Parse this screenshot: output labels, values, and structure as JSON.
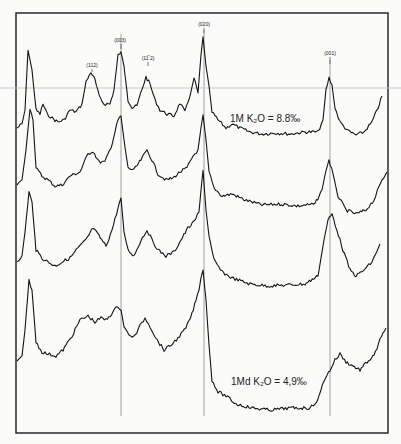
{
  "chart_data": {
    "type": "line",
    "title": "",
    "xlabel": "",
    "ylabel": "",
    "grid": false,
    "peak_labels": [
      {
        "label": "(112)",
        "x": 92
      },
      {
        "label": "(003)",
        "x": 121
      },
      {
        "label": "(11̅ 2)",
        "x": 148
      },
      {
        "label": "(020)",
        "x": 204
      },
      {
        "label": "(001)",
        "x": 330
      }
    ],
    "reference_lines_x": [
      121,
      204,
      330
    ],
    "annotations": [
      {
        "text": "1M  K₂O = 8.8‰",
        "x": 230,
        "y": 122
      },
      {
        "text": "1Md  K₂O = 4,9‰",
        "x": 231,
        "y": 385
      }
    ],
    "series": [
      {
        "name": "1M K2O = 8.8",
        "points": [
          [
            17,
            128
          ],
          [
            22,
            124
          ],
          [
            25,
            110
          ],
          [
            28,
            50
          ],
          [
            32,
            70
          ],
          [
            36,
            110
          ],
          [
            40,
            114
          ],
          [
            43,
            104
          ],
          [
            47,
            114
          ],
          [
            52,
            118
          ],
          [
            58,
            122
          ],
          [
            64,
            120
          ],
          [
            70,
            110
          ],
          [
            76,
            112
          ],
          [
            82,
            104
          ],
          [
            86,
            82
          ],
          [
            91,
            72
          ],
          [
            95,
            80
          ],
          [
            99,
            96
          ],
          [
            104,
            104
          ],
          [
            110,
            104
          ],
          [
            114,
            90
          ],
          [
            118,
            55
          ],
          [
            121,
            52
          ],
          [
            124,
            66
          ],
          [
            128,
            100
          ],
          [
            132,
            108
          ],
          [
            137,
            106
          ],
          [
            141,
            92
          ],
          [
            146,
            77
          ],
          [
            150,
            84
          ],
          [
            155,
            100
          ],
          [
            160,
            110
          ],
          [
            167,
            114
          ],
          [
            174,
            116
          ],
          [
            180,
            103
          ],
          [
            185,
            112
          ],
          [
            190,
            96
          ],
          [
            194,
            78
          ],
          [
            198,
            93
          ],
          [
            201,
            55
          ],
          [
            203,
            37
          ],
          [
            206,
            66
          ],
          [
            209,
            86
          ],
          [
            212,
            112
          ],
          [
            218,
            120
          ],
          [
            226,
            128
          ],
          [
            232,
            124
          ],
          [
            240,
            128
          ],
          [
            250,
            132
          ],
          [
            262,
            134
          ],
          [
            275,
            133
          ],
          [
            290,
            134
          ],
          [
            305,
            132
          ],
          [
            318,
            132
          ],
          [
            323,
            120
          ],
          [
            326,
            90
          ],
          [
            329,
            78
          ],
          [
            332,
            85
          ],
          [
            335,
            108
          ],
          [
            340,
            122
          ],
          [
            348,
            131
          ],
          [
            356,
            135
          ],
          [
            364,
            132
          ],
          [
            372,
            122
          ],
          [
            378,
            108
          ],
          [
            382,
            96
          ]
        ]
      },
      {
        "name": "trace 2",
        "points": [
          [
            17,
            185
          ],
          [
            22,
            180
          ],
          [
            26,
            150
          ],
          [
            30,
            108
          ],
          [
            33,
            120
          ],
          [
            36,
            168
          ],
          [
            42,
            176
          ],
          [
            48,
            180
          ],
          [
            55,
            186
          ],
          [
            62,
            185
          ],
          [
            70,
            176
          ],
          [
            80,
            172
          ],
          [
            88,
            154
          ],
          [
            93,
            151
          ],
          [
            99,
            162
          ],
          [
            105,
            162
          ],
          [
            112,
            144
          ],
          [
            118,
            120
          ],
          [
            121,
            116
          ],
          [
            124,
            140
          ],
          [
            128,
            168
          ],
          [
            134,
            170
          ],
          [
            141,
            160
          ],
          [
            147,
            150
          ],
          [
            152,
            160
          ],
          [
            158,
            174
          ],
          [
            166,
            180
          ],
          [
            173,
            178
          ],
          [
            180,
            172
          ],
          [
            187,
            168
          ],
          [
            193,
            156
          ],
          [
            198,
            150
          ],
          [
            201,
            128
          ],
          [
            203,
            115
          ],
          [
            206,
            140
          ],
          [
            209,
            172
          ],
          [
            214,
            188
          ],
          [
            222,
            196
          ],
          [
            232,
            194
          ],
          [
            245,
            200
          ],
          [
            262,
            205
          ],
          [
            280,
            204
          ],
          [
            298,
            206
          ],
          [
            315,
            204
          ],
          [
            322,
            190
          ],
          [
            326,
            170
          ],
          [
            329,
            160
          ],
          [
            333,
            174
          ],
          [
            338,
            196
          ],
          [
            346,
            210
          ],
          [
            356,
            214
          ],
          [
            366,
            210
          ],
          [
            374,
            200
          ],
          [
            382,
            180
          ],
          [
            387,
            172
          ]
        ]
      },
      {
        "name": "trace 3",
        "points": [
          [
            17,
            261
          ],
          [
            22,
            256
          ],
          [
            25,
            232
          ],
          [
            29,
            192
          ],
          [
            32,
            202
          ],
          [
            36,
            250
          ],
          [
            42,
            258
          ],
          [
            48,
            262
          ],
          [
            55,
            266
          ],
          [
            62,
            262
          ],
          [
            70,
            258
          ],
          [
            78,
            248
          ],
          [
            86,
            240
          ],
          [
            93,
            228
          ],
          [
            99,
            236
          ],
          [
            106,
            246
          ],
          [
            112,
            230
          ],
          [
            118,
            208
          ],
          [
            121,
            198
          ],
          [
            124,
            232
          ],
          [
            128,
            250
          ],
          [
            134,
            256
          ],
          [
            141,
            240
          ],
          [
            147,
            230
          ],
          [
            152,
            240
          ],
          [
            158,
            250
          ],
          [
            166,
            256
          ],
          [
            174,
            252
          ],
          [
            181,
            240
          ],
          [
            188,
            228
          ],
          [
            194,
            222
          ],
          [
            199,
            212
          ],
          [
            201,
            190
          ],
          [
            203,
            170
          ],
          [
            206,
            210
          ],
          [
            209,
            236
          ],
          [
            214,
            260
          ],
          [
            222,
            272
          ],
          [
            232,
            278
          ],
          [
            250,
            284
          ],
          [
            268,
            286
          ],
          [
            288,
            285
          ],
          [
            305,
            284
          ],
          [
            318,
            276
          ],
          [
            324,
            240
          ],
          [
            328,
            220
          ],
          [
            332,
            214
          ],
          [
            337,
            230
          ],
          [
            343,
            250
          ],
          [
            350,
            270
          ],
          [
            356,
            276
          ],
          [
            364,
            270
          ],
          [
            372,
            262
          ],
          [
            380,
            244
          ]
        ]
      },
      {
        "name": "1Md K2O = 4,9",
        "points": [
          [
            17,
            362
          ],
          [
            22,
            356
          ],
          [
            25,
            330
          ],
          [
            29,
            280
          ],
          [
            32,
            290
          ],
          [
            36,
            342
          ],
          [
            42,
            352
          ],
          [
            48,
            354
          ],
          [
            56,
            356
          ],
          [
            63,
            350
          ],
          [
            72,
            336
          ],
          [
            80,
            320
          ],
          [
            88,
            316
          ],
          [
            95,
            322
          ],
          [
            101,
            318
          ],
          [
            106,
            320
          ],
          [
            113,
            312
          ],
          [
            118,
            306
          ],
          [
            121,
            310
          ],
          [
            124,
            326
          ],
          [
            129,
            336
          ],
          [
            135,
            336
          ],
          [
            140,
            326
          ],
          [
            145,
            318
          ],
          [
            150,
            326
          ],
          [
            157,
            340
          ],
          [
            164,
            350
          ],
          [
            170,
            346
          ],
          [
            178,
            338
          ],
          [
            186,
            328
          ],
          [
            192,
            314
          ],
          [
            196,
            300
          ],
          [
            199,
            290
          ],
          [
            201,
            278
          ],
          [
            203,
            270
          ],
          [
            206,
            300
          ],
          [
            209,
            345
          ],
          [
            212,
            380
          ],
          [
            218,
            392
          ],
          [
            226,
            396
          ],
          [
            236,
            404
          ],
          [
            252,
            408
          ],
          [
            270,
            410
          ],
          [
            290,
            408
          ],
          [
            310,
            408
          ],
          [
            318,
            400
          ],
          [
            324,
            380
          ],
          [
            330,
            370
          ],
          [
            335,
            360
          ],
          [
            340,
            354
          ],
          [
            346,
            362
          ],
          [
            353,
            366
          ],
          [
            360,
            370
          ],
          [
            367,
            362
          ],
          [
            374,
            356
          ],
          [
            380,
            340
          ],
          [
            386,
            328
          ]
        ]
      }
    ],
    "colors": {
      "trace": "#141414",
      "frame": "#1a1a1a",
      "ref_line": "#8a8a8a",
      "scan_artifact": "#c8c8c8",
      "background": "#fbfbfa"
    }
  },
  "labels": {
    "p112": "(112)",
    "p003": "(003)",
    "p11b2": "(11̅ 2)",
    "p020": "(020)",
    "p001": "(001)",
    "note1": "1M  K₂O = 8.8‰",
    "note2": "1Md  K₂O = 4,9‰"
  }
}
